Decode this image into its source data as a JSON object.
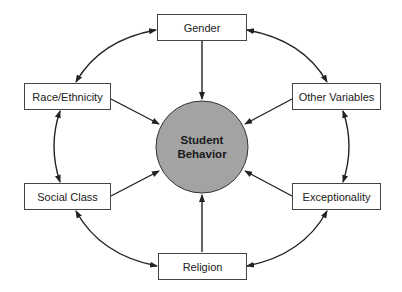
{
  "center": {
    "line1": "Student",
    "line2": "Behavior",
    "fill": "#a3a3a3"
  },
  "nodes": [
    {
      "id": "gender",
      "label": "Gender"
    },
    {
      "id": "race",
      "label": "Race/Ethnicity"
    },
    {
      "id": "other",
      "label": "Other Variables"
    },
    {
      "id": "social",
      "label": "Social Class"
    },
    {
      "id": "exceptionality",
      "label": "Exceptionality"
    },
    {
      "id": "religion",
      "label": "Religion"
    }
  ]
}
